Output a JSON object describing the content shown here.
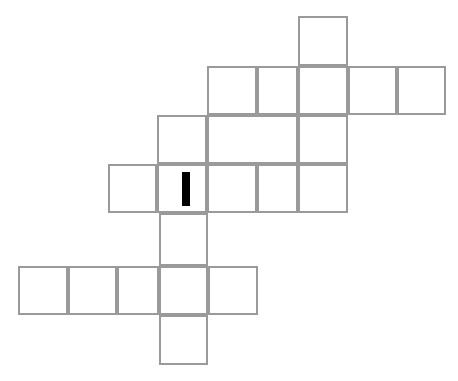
{
  "canvas": {
    "width": 458,
    "height": 381,
    "background": "#ffffff"
  },
  "puzzle": {
    "name": "crossword-grid",
    "cell_size": 50,
    "grid_line_color": "#9a9a9a",
    "cell_fill_color": "#ffffff",
    "cursor_color": "#000000",
    "total_cells": 22,
    "rows": [
      {
        "index": 1,
        "y": 16,
        "height": 50,
        "cells": [
          {
            "id": "r1c7",
            "x": 298,
            "width": 50,
            "letter": ""
          }
        ]
      },
      {
        "index": 2,
        "y": 66,
        "height": 49,
        "cells": [
          {
            "id": "r2c5",
            "x": 207,
            "width": 50,
            "letter": ""
          },
          {
            "id": "r2c6",
            "x": 257,
            "width": 41,
            "letter": ""
          },
          {
            "id": "r2c7",
            "x": 298,
            "width": 50,
            "letter": ""
          },
          {
            "id": "r2c8",
            "x": 348,
            "width": 49,
            "letter": ""
          },
          {
            "id": "r2c9",
            "x": 397,
            "width": 49,
            "letter": ""
          }
        ]
      },
      {
        "index": 3,
        "y": 115,
        "height": 49,
        "cells": [
          {
            "id": "r3c4",
            "x": 157,
            "width": 50,
            "letter": ""
          },
          {
            "id": "r3c5",
            "x": 207,
            "width": 91,
            "letter": ""
          },
          {
            "id": "r3c7",
            "x": 298,
            "width": 50,
            "letter": ""
          }
        ]
      },
      {
        "index": 4,
        "y": 164,
        "height": 49,
        "cells": [
          {
            "id": "r4c3",
            "x": 108,
            "width": 49,
            "letter": ""
          },
          {
            "id": "r4c4",
            "x": 157,
            "width": 50,
            "letter": "",
            "cursor": true
          },
          {
            "id": "r4c5",
            "x": 207,
            "width": 50,
            "letter": ""
          },
          {
            "id": "r4c6",
            "x": 257,
            "width": 41,
            "letter": ""
          },
          {
            "id": "r4c7",
            "x": 298,
            "width": 50,
            "letter": ""
          }
        ]
      },
      {
        "index": 5,
        "y": 213,
        "height": 53,
        "cells": [
          {
            "id": "r5c4",
            "x": 159,
            "width": 49,
            "letter": ""
          }
        ]
      },
      {
        "index": 6,
        "y": 266,
        "height": 49,
        "cells": [
          {
            "id": "r6c1",
            "x": 18,
            "width": 50,
            "letter": ""
          },
          {
            "id": "r6c2",
            "x": 68,
            "width": 49,
            "letter": ""
          },
          {
            "id": "r6c3",
            "x": 117,
            "width": 42,
            "letter": ""
          },
          {
            "id": "r6c4",
            "x": 159,
            "width": 49,
            "letter": ""
          },
          {
            "id": "r6c5",
            "x": 208,
            "width": 50,
            "letter": ""
          }
        ]
      },
      {
        "index": 7,
        "y": 315,
        "height": 50,
        "cells": [
          {
            "id": "r7c4",
            "x": 159,
            "width": 49,
            "letter": ""
          }
        ]
      }
    ],
    "cursor": {
      "name": "text-cursor",
      "cell_id": "r4c4",
      "x": 182,
      "y": 172,
      "width": 8,
      "height": 34,
      "color": "#000000"
    }
  }
}
